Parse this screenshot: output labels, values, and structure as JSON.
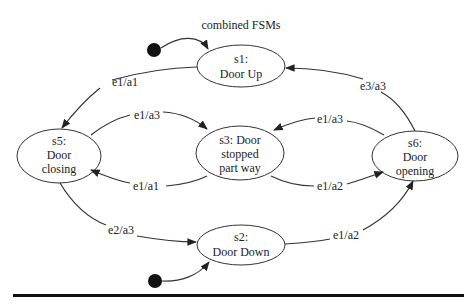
{
  "title": "combined FSMs",
  "states": [
    {
      "id": "s1",
      "lines": [
        "s1:",
        "Door Up"
      ]
    },
    {
      "id": "s2",
      "lines": [
        "s2:",
        "Door Down"
      ]
    },
    {
      "id": "s3",
      "lines": [
        "s3: Door",
        "stopped",
        "part way"
      ]
    },
    {
      "id": "s5",
      "lines": [
        "s5:",
        "Door",
        "closing"
      ]
    },
    {
      "id": "s6",
      "lines": [
        "s6:",
        "Door",
        "opening"
      ]
    }
  ],
  "transitions": [
    {
      "from": "start",
      "to": "s1",
      "label": ""
    },
    {
      "from": "start",
      "to": "s2",
      "label": ""
    },
    {
      "from": "s1",
      "to": "s5",
      "label": "e1/a1"
    },
    {
      "from": "s5",
      "to": "s3",
      "label": "e1/a3"
    },
    {
      "from": "s3",
      "to": "s5",
      "label": "e1/a1"
    },
    {
      "from": "s5",
      "to": "s2",
      "label": "e2/a3"
    },
    {
      "from": "s6",
      "to": "s1",
      "label": "e3/a3"
    },
    {
      "from": "s6",
      "to": "s3",
      "label": "e1/a3"
    },
    {
      "from": "s3",
      "to": "s6",
      "label": "e1/a2"
    },
    {
      "from": "s2",
      "to": "s6",
      "label": "e1/a2"
    }
  ]
}
